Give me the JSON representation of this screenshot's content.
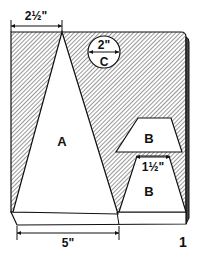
{
  "figure": {
    "number": "1",
    "colors": {
      "ink": "#111111",
      "paper": "#ffffff",
      "hatch": "#222222"
    }
  },
  "pieces": [
    {
      "id": "A",
      "label": "A",
      "shape": "triangle"
    },
    {
      "id": "B-upper",
      "label": "B",
      "shape": "trapezoid"
    },
    {
      "id": "B-lower",
      "label": "B",
      "shape": "trapezoid"
    },
    {
      "id": "C",
      "label": "C",
      "shape": "circle"
    }
  ],
  "dimensions": {
    "top_width": "2½\"",
    "circle_diameter": "2\"",
    "trapezoid_width": "1½\"",
    "base_width": "5\""
  }
}
